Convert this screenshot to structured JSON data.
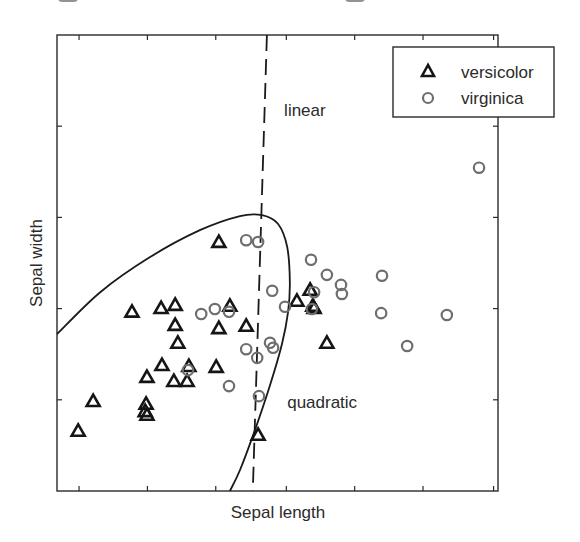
{
  "chart_data": {
    "type": "scatter",
    "title": "",
    "xlabel": "Sepal length",
    "ylabel": "Sepal width",
    "xlim": [
      0,
      100
    ],
    "ylim": [
      0,
      100
    ],
    "grid": false,
    "legend_position": "upper right",
    "tick_labels_shown": false,
    "x_ticks": [
      5,
      20.5,
      36,
      52,
      67.5,
      83,
      99
    ],
    "y_ticks": [
      20,
      40,
      60,
      80
    ],
    "series": [
      {
        "name": "versicolor",
        "marker": "triangle",
        "color": "#151515",
        "points": [
          [
            4.8,
            13.2
          ],
          [
            8.2,
            19.7
          ],
          [
            17.0,
            39.3
          ],
          [
            23.6,
            40.1
          ],
          [
            26.8,
            40.8
          ],
          [
            26.8,
            36.4
          ],
          [
            27.4,
            32.5
          ],
          [
            23.8,
            27.6
          ],
          [
            29.9,
            27.4
          ],
          [
            20.4,
            25.0
          ],
          [
            26.5,
            24.1
          ],
          [
            29.5,
            24.1
          ],
          [
            20.2,
            19.1
          ],
          [
            20.0,
            17.5
          ],
          [
            20.4,
            16.7
          ],
          [
            36.7,
            54.6
          ],
          [
            39.2,
            40.6
          ],
          [
            36.7,
            35.7
          ],
          [
            42.9,
            36.2
          ],
          [
            36.1,
            27.2
          ],
          [
            45.6,
            12.3
          ],
          [
            54.4,
            41.7
          ],
          [
            57.4,
            44.1
          ],
          [
            58.0,
            40.6
          ],
          [
            58.3,
            40.1
          ],
          [
            61.2,
            32.5
          ]
        ]
      },
      {
        "name": "virginica",
        "marker": "circle",
        "color": "#6e6e6e",
        "points": [
          [
            32.7,
            38.8
          ],
          [
            35.8,
            39.9
          ],
          [
            39.0,
            39.3
          ],
          [
            29.7,
            26.5
          ],
          [
            39.0,
            23.0
          ],
          [
            42.9,
            55.0
          ],
          [
            45.6,
            54.6
          ],
          [
            42.9,
            31.1
          ],
          [
            45.4,
            29.2
          ],
          [
            48.3,
            32.5
          ],
          [
            49.0,
            31.4
          ],
          [
            45.8,
            20.8
          ],
          [
            48.8,
            43.9
          ],
          [
            51.7,
            40.4
          ],
          [
            57.6,
            50.7
          ],
          [
            61.2,
            47.4
          ],
          [
            64.4,
            45.2
          ],
          [
            64.6,
            43.2
          ],
          [
            58.3,
            43.6
          ],
          [
            57.8,
            39.9
          ],
          [
            73.7,
            47.2
          ],
          [
            73.5,
            39.0
          ],
          [
            79.4,
            31.8
          ],
          [
            88.4,
            38.6
          ],
          [
            95.7,
            70.9
          ]
        ]
      }
    ],
    "boundaries": [
      {
        "name": "linear",
        "style": "dashed",
        "points": [
          [
            47.6,
            100
          ],
          [
            44.4,
            0
          ]
        ]
      },
      {
        "name": "quadratic",
        "style": "solid",
        "points": [
          [
            0,
            34.4
          ],
          [
            9.8,
            43.6
          ],
          [
            21.1,
            51.3
          ],
          [
            32.4,
            57.2
          ],
          [
            41.5,
            60.3
          ],
          [
            46.5,
            60.5
          ],
          [
            50.1,
            58.6
          ],
          [
            52.2,
            53.5
          ],
          [
            52.8,
            45.8
          ],
          [
            52.4,
            39.3
          ],
          [
            51.0,
            32.2
          ],
          [
            48.3,
            23.2
          ],
          [
            44.9,
            13.4
          ],
          [
            41.5,
            4.6
          ],
          [
            39.2,
            0
          ]
        ]
      }
    ],
    "annotations": [
      {
        "text": "linear",
        "x": 51.5,
        "y": 83.6
      },
      {
        "text": "quadratic",
        "x": 52.2,
        "y": 19.5
      }
    ]
  },
  "legend": {
    "items": [
      {
        "label": "versicolor",
        "marker": "triangle"
      },
      {
        "label": "virginica",
        "marker": "circle"
      }
    ]
  },
  "axes": {
    "xlabel": "Sepal length",
    "ylabel": "Sepal width"
  },
  "annotations": {
    "linear": "linear",
    "quadratic": "quadratic"
  }
}
